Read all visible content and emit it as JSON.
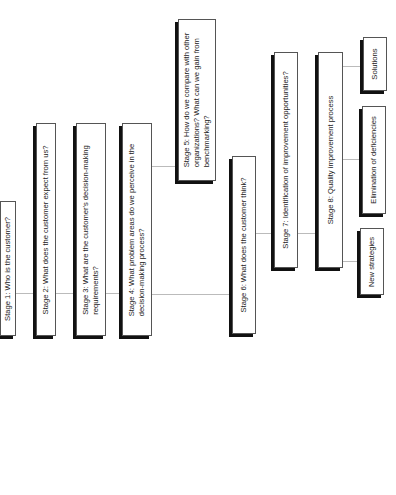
{
  "diagram": {
    "nodes": [
      {
        "id": "stage1",
        "label": "Stage 1: Who is the customer?"
      },
      {
        "id": "stage2",
        "label": "Stage 2: What does the customer expect from us?"
      },
      {
        "id": "stage3",
        "label": "Stage 3: What are the customer's decision-making\nrequirements?"
      },
      {
        "id": "stage4",
        "label": "Stage 4: What problem areas do we perceive in the\ndecision-making process?"
      },
      {
        "id": "stage5",
        "label": "Stage 5: How do we compare with other\norganizations? What can we gain from\nbenchmarking?"
      },
      {
        "id": "stage6",
        "label": "Stage 6: What does the customer think?"
      },
      {
        "id": "stage7",
        "label": "Stage 7: Identification of improvement opportunities?"
      },
      {
        "id": "stage8",
        "label": "Stage 8: Quality improvement process"
      },
      {
        "id": "new-strategies",
        "label": "New strategies"
      },
      {
        "id": "elimination",
        "label": "Elimination of deficiencies"
      },
      {
        "id": "solutions",
        "label": "Solutions"
      }
    ],
    "edges": [
      [
        "stage1",
        "stage2"
      ],
      [
        "stage2",
        "stage3"
      ],
      [
        "stage3",
        "stage4"
      ],
      [
        "stage4",
        "stage5"
      ],
      [
        "stage4",
        "stage6"
      ],
      [
        "stage6",
        "stage7"
      ],
      [
        "stage7",
        "stage8"
      ],
      [
        "stage8",
        "new-strategies"
      ],
      [
        "stage8",
        "elimination"
      ],
      [
        "stage8",
        "solutions"
      ]
    ]
  }
}
